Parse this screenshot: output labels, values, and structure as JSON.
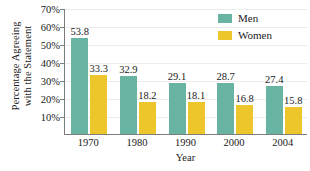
{
  "chart_data": {
    "type": "bar",
    "title": "",
    "xlabel": "Year",
    "ylabel_line1": "Percentage Agreeing",
    "ylabel_line2": "with the Statement",
    "categories": [
      "1970",
      "1980",
      "1990",
      "2000",
      "2004"
    ],
    "series": [
      {
        "name": "Men",
        "values": [
          53.8,
          32.9,
          29.1,
          28.7,
          27.4
        ],
        "color": "#69b3a2"
      },
      {
        "name": "Women",
        "values": [
          33.3,
          18.2,
          18.1,
          16.8,
          15.8
        ],
        "color": "#edc62c"
      }
    ],
    "ylim": [
      0,
      70
    ],
    "ytick_values": [
      10,
      20,
      30,
      40,
      50,
      60,
      70
    ],
    "ytick_labels": [
      "10%",
      "20%",
      "30%",
      "40%",
      "50%",
      "60%",
      "70%"
    ],
    "grid": true,
    "legend_position": "top-right",
    "data_labels": true
  },
  "legend": {
    "items": [
      {
        "label": "Men",
        "color": "#69b3a2"
      },
      {
        "label": "Women",
        "color": "#edc62c"
      }
    ]
  }
}
